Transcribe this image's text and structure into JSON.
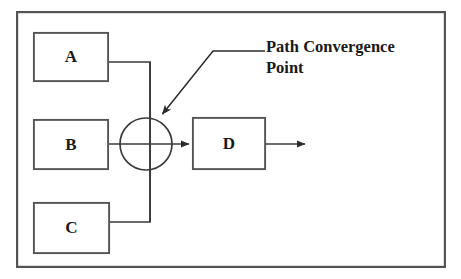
{
  "diagram": {
    "type": "block-flow-diagram",
    "frame": {
      "name": "outer-border",
      "x": 16,
      "y": 11,
      "width": 430,
      "height": 257,
      "stroke": "#4d4d4d",
      "stroke_width": 2.2,
      "fill": "#ffffff"
    },
    "colors": {
      "stroke": "#4d4d4d",
      "line": "#3a3a3a",
      "text": "#1a1a1a",
      "background": "#ffffff"
    },
    "nodes": [
      {
        "id": "A",
        "label": "A",
        "name": "node-box-a",
        "x": 33,
        "y": 32,
        "width": 76,
        "height": 50
      },
      {
        "id": "B",
        "label": "B",
        "name": "node-box-b",
        "x": 33,
        "y": 119,
        "width": 76,
        "height": 51
      },
      {
        "id": "C",
        "label": "C",
        "name": "node-box-c",
        "x": 33,
        "y": 202,
        "width": 77,
        "height": 52
      },
      {
        "id": "D",
        "label": "D",
        "name": "node-box-d",
        "x": 192,
        "y": 117,
        "width": 74,
        "height": 53
      }
    ],
    "junction": {
      "name": "convergence-circle",
      "cx": 146,
      "cy": 144,
      "r": 26
    },
    "connectors": [
      {
        "name": "connector-a-to-junction",
        "from": "A",
        "to": "junction",
        "path": "M 109 62 L 150 62 L 150 144"
      },
      {
        "name": "connector-b-to-junction",
        "from": "B",
        "to": "junction",
        "path": "M 109 144 L 178 144"
      },
      {
        "name": "connector-c-to-junction",
        "from": "C",
        "to": "junction",
        "path": "M 110 222 L 150 222 L 150 144"
      },
      {
        "name": "connector-junction-to-d",
        "from": "junction",
        "to": "D",
        "path": "M 150 144 L 190 144",
        "arrow": true
      },
      {
        "name": "connector-d-output",
        "from": "D",
        "to": "output",
        "path": "M 266 144 L 306 144",
        "arrow": true
      }
    ],
    "annotation": {
      "name": "path-convergence-annotation",
      "lines": [
        "Path Convergence",
        "Point"
      ],
      "text_x": 266,
      "line1_y": 52,
      "line2_y": 73,
      "leader_path": "M 264 51 L 213 51 L 161 116",
      "arrow_tip_x": 157,
      "arrow_tip_y": 120
    }
  }
}
